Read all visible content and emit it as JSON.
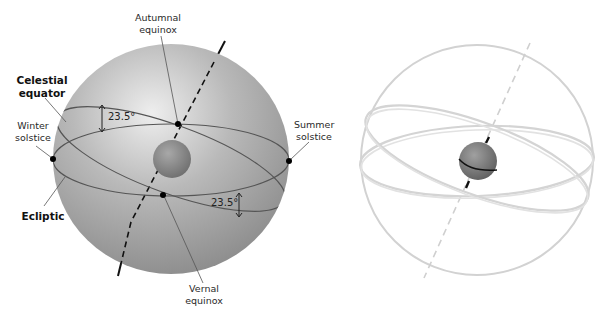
{
  "figure": {
    "left_panel": {
      "name": "celestial-sphere-labeled",
      "labels": {
        "autumnal_equinox": [
          "Autumnal",
          "equinox"
        ],
        "celestial_equator": [
          "Celestial",
          "equator"
        ],
        "winter_solstice": [
          "Winter",
          "solstice"
        ],
        "ecliptic": "Ecliptic",
        "summer_solstice": [
          "Summer",
          "solstice"
        ],
        "vernal_equinox": [
          "Vernal",
          "equinox"
        ],
        "tilt_angle_upper": "23.5°",
        "tilt_angle_lower": "23.5°"
      },
      "points": [
        "Autumnal equinox",
        "Vernal equinox",
        "Winter solstice",
        "Summer solstice"
      ]
    },
    "right_panel": {
      "name": "celestial-sphere-wireframe",
      "rings": [
        "Celestial equator",
        "Ecliptic"
      ]
    },
    "colors": {
      "sphere_light": "#e6e6e6",
      "sphere_dark": "#8e8e8e",
      "ring_line": "#5a5a5a",
      "wire_ring": "#d2d2d2",
      "dot": "#000000",
      "earth": "#8a8a8a"
    }
  }
}
